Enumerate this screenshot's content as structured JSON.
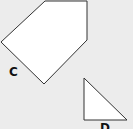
{
  "diagram": {
    "background": "#ececec",
    "shape_fill": "#ffffff",
    "stroke_color": "#333333",
    "shapes": [
      {
        "id": "C",
        "type": "pentagon",
        "label": "C",
        "points": "45,1 87,1 87,40 44,84 1,42",
        "label_pos": {
          "x": 9,
          "y": 66
        }
      },
      {
        "id": "D",
        "type": "right-triangle",
        "label": "D",
        "points": "84,78 84,120 127,120",
        "label_pos": {
          "x": 100,
          "y": 122
        }
      }
    ]
  }
}
